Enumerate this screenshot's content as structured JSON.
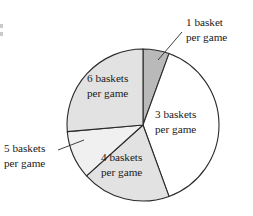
{
  "figure": {
    "background_color": "#ffffff",
    "outline_color": "#2b2b2b",
    "text_color": "#1a1a1a"
  },
  "chart_data": {
    "type": "pie",
    "title": "",
    "subtitle": "",
    "xlabel": "",
    "ylabel": "",
    "grid": false,
    "legend_position": "none",
    "label_style": "slice labels with leader-line callouts",
    "center": {
      "x": 143,
      "y": 125
    },
    "radius": 76,
    "start_angle_deg": 0,
    "direction": "clockwise",
    "categories": [
      "1 basket per game",
      "3 baskets per game",
      "4 baskets per game",
      "5 baskets per game",
      "6 baskets per game"
    ],
    "values": [
      5.6,
      38.9,
      18.9,
      10.3,
      26.4
    ],
    "value_unit": "percent",
    "slices": [
      {
        "label_line1": "1 basket",
        "label_line2": "per game",
        "baskets": 1,
        "percent": 5.6,
        "start_angle_deg": 0,
        "end_angle_deg": 20,
        "fill": "#b9b9b9",
        "label_placement": "callout-right",
        "label_x": 186,
        "label_y": 26,
        "leader_from_x": 182,
        "leader_from_y": 32,
        "leader_to_x": 158,
        "leader_to_y": 60
      },
      {
        "label_line1": "3 baskets",
        "label_line2": "per game",
        "baskets": 3,
        "percent": 38.9,
        "start_angle_deg": 20,
        "end_angle_deg": 160,
        "fill": "#ffffff",
        "label_placement": "inside",
        "label_x": 155,
        "label_y": 118
      },
      {
        "label_line1": "4 baskets",
        "label_line2": "per game",
        "baskets": 4,
        "percent": 18.9,
        "start_angle_deg": 160,
        "end_angle_deg": 228,
        "fill": "#e2e2e2",
        "label_placement": "inside",
        "label_x": 101,
        "label_y": 161
      },
      {
        "label_line1": "5 baskets",
        "label_line2": "per game",
        "baskets": 5,
        "percent": 10.3,
        "start_angle_deg": 228,
        "end_angle_deg": 265,
        "fill": "#f0f0f0",
        "label_placement": "callout-left",
        "label_x": 4,
        "label_y": 152,
        "leader_from_x": 58,
        "leader_from_y": 150,
        "leader_to_x": 84,
        "leader_to_y": 140
      },
      {
        "label_line1": "6 baskets",
        "label_line2": "per game",
        "baskets": 6,
        "percent": 26.4,
        "start_angle_deg": 265,
        "end_angle_deg": 360,
        "fill": "#e2e2e2",
        "label_placement": "inside",
        "label_x": 87,
        "label_y": 82
      }
    ]
  }
}
